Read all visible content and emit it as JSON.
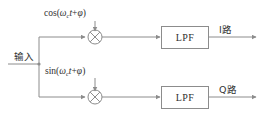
{
  "diagram": {
    "stroke_color": "#8c8c8c",
    "text_color": "#2f2f2f",
    "background": "#ffffff",
    "input": {
      "label": "输入"
    },
    "carriers": {
      "upper": {
        "prefix": "cos(",
        "omega": "ω",
        "subscript": "c",
        "var": "t",
        "plus": "+",
        "phase": "φ",
        "suffix": ")",
        "full": "cos(ωct+φ)"
      },
      "lower": {
        "prefix": "sin(",
        "omega": "ω",
        "subscript": "c",
        "var": "t",
        "plus": "+",
        "phase": "φ",
        "suffix": ")",
        "full": "sin(ωct+φ)"
      }
    },
    "mixers": [
      {
        "name": "upper-mixer",
        "symbol": "×"
      },
      {
        "name": "lower-mixer",
        "symbol": "×"
      }
    ],
    "filters": [
      {
        "name": "upper-lpf",
        "label": "LPF"
      },
      {
        "name": "lower-lpf",
        "label": "LPF"
      }
    ],
    "outputs": [
      {
        "name": "i-branch",
        "label": "I路"
      },
      {
        "name": "q-branch",
        "label": "Q路"
      }
    ]
  }
}
